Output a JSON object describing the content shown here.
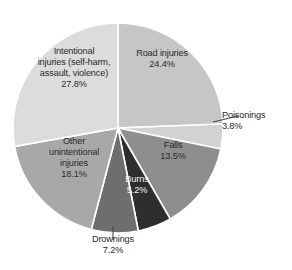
{
  "chart_data": {
    "type": "pie",
    "title": "",
    "subtitle": "",
    "xlabel": "",
    "ylabel": "",
    "legend_position": "none",
    "grid": false,
    "labels_on_slices": true,
    "start_angle_deg": 0,
    "direction": "clockwise",
    "categories": [
      "Road injuries",
      "Poisonings",
      "Falls",
      "Burns",
      "Drownings",
      "Other unintentional injuries",
      "Intentional injuries (self-harm, assault, violence)"
    ],
    "values": [
      24.4,
      3.8,
      13.5,
      5.2,
      7.2,
      18.1,
      27.8
    ],
    "value_suffix": "%",
    "slices": [
      {
        "id": "road-injuries",
        "label": "Road injuries",
        "label_lines": "Road injuries",
        "value": 24.4,
        "value_text": "24.4%",
        "color": "#c6c6c6",
        "label_color": "#2b2b2b",
        "leader": false
      },
      {
        "id": "poisonings",
        "label": "Poisonings",
        "label_lines": "Poisonings",
        "value": 3.8,
        "value_text": "3.8%",
        "color": "#d2d2d2",
        "label_color": "#2b2b2b",
        "leader": true
      },
      {
        "id": "falls",
        "label": "Falls",
        "label_lines": "Falls",
        "value": 13.5,
        "value_text": "13.5%",
        "color": "#8e8e8e",
        "label_color": "#2b2b2b",
        "leader": false
      },
      {
        "id": "burns",
        "label": "Burns",
        "label_lines": "Burns",
        "value": 5.2,
        "value_text": "5.2%",
        "color": "#2e2e2e",
        "label_color": "#f2f2f2",
        "leader": false
      },
      {
        "id": "drownings",
        "label": "Drownings",
        "label_lines": "Drownings",
        "value": 7.2,
        "value_text": "7.2%",
        "color": "#6e6e6e",
        "label_color": "#2b2b2b",
        "leader": true
      },
      {
        "id": "other-unintentional-injuries",
        "label": "Other unintentional injuries",
        "label_lines": "Other\nunintentional\ninjuries",
        "value": 18.1,
        "value_text": "18.1%",
        "color": "#a8a8a8",
        "label_color": "#2b2b2b",
        "leader": false
      },
      {
        "id": "intentional-injuries",
        "label": "Intentional injuries (self-harm, assault, violence)",
        "label_lines": "Intentional\ninjuries (self-harm,\nassault, violence)",
        "value": 27.8,
        "value_text": "27.8%",
        "color": "#dcdcdc",
        "label_color": "#2b2b2b",
        "leader": false
      }
    ],
    "total": 100.0,
    "background_color": "#ffffff",
    "slice_border_color": "#ffffff"
  }
}
